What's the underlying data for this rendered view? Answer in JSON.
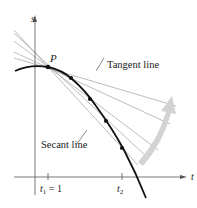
{
  "diagram": {
    "axes": {
      "vertical_label": "s",
      "horizontal_label": "t"
    },
    "point_label": "P",
    "labels": {
      "tangent": "Tangent line",
      "secant": "Secant line"
    },
    "ticks": {
      "t1_var": "t",
      "t1_sub": "1",
      "t1_eq": " = 1",
      "t2_var": "t",
      "t2_sub": "2"
    },
    "colors": {
      "curve": "#111111",
      "lines": "#9a9a9a",
      "axis": "#555555",
      "arrow": "#d0d0d0",
      "text": "#222222"
    }
  }
}
